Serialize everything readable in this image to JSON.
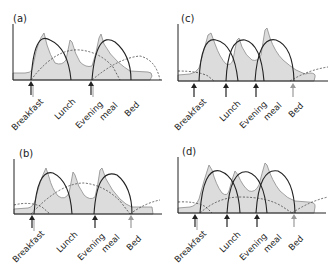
{
  "figure": {
    "panels": [
      {
        "id": "a",
        "label": "(a)",
        "events": [
          "Breakfast",
          "Lunch",
          "Evening",
          "meal",
          "Bed"
        ],
        "insulin_arrows": [
          "Breakfast",
          "Evening meal"
        ],
        "description": "Twice-daily insulin regimen: glucose curve (shaded) with two solid insulin arcs and long-acting dotted curves"
      },
      {
        "id": "c",
        "label": "(c)",
        "events": [
          "Breakfast",
          "Lunch",
          "Evening",
          "meal",
          "Bed"
        ],
        "insulin_arrows": [
          "Breakfast",
          "Lunch",
          "Evening meal",
          "Bed"
        ],
        "description": "Basal-bolus regimen: three solid mealtime insulin arcs and bedtime basal dotted curve"
      },
      {
        "id": "b",
        "label": "(b)",
        "events": [
          "Breakfast",
          "Lunch",
          "Evening",
          "meal",
          "Bed"
        ],
        "insulin_arrows": [
          "Breakfast",
          "Evening meal",
          "Bed"
        ],
        "description": "Two mealtime insulin arcs plus intermediate-acting dotted curves"
      },
      {
        "id": "d",
        "label": "(d)",
        "events": [
          "Breakfast",
          "Lunch",
          "Evening",
          "meal",
          "Bed"
        ],
        "insulin_arrows": [
          "Breakfast",
          "Lunch",
          "Evening meal",
          "Bed"
        ],
        "description": "Three mealtime insulin arcs plus twice-daily basal dotted curves"
      }
    ],
    "colors": {
      "glucose_fill": "#dcdcdc",
      "glucose_stroke": "#8a8a8a",
      "insulin_arc": "#222222",
      "arrow_primary": "#222222",
      "arrow_secondary": "#9a9a9a",
      "axis": "#222222"
    }
  }
}
